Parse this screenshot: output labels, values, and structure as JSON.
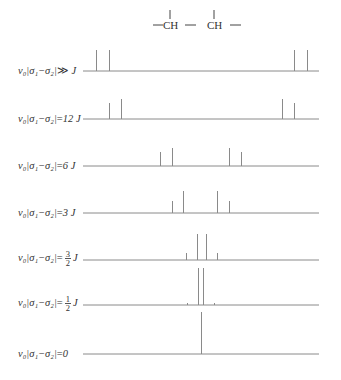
{
  "structure": {
    "groups": [
      "CH",
      "CH"
    ],
    "formula_text": "—CH—CH—"
  },
  "rows": [
    {
      "label_prefix": "ν₀|σ₁−σ₂|",
      "label_rel": "≫",
      "label_value": "J",
      "frac": null
    },
    {
      "label_prefix": "ν₀|σ₁−σ₂|",
      "label_rel": "=",
      "label_value": "12 J",
      "frac": null
    },
    {
      "label_prefix": "ν₀|σ₁−σ₂|",
      "label_rel": "=",
      "label_value": "6 J",
      "frac": null
    },
    {
      "label_prefix": "ν₀|σ₁−σ₂|",
      "label_rel": "=",
      "label_value": "3 J",
      "frac": null
    },
    {
      "label_prefix": "ν₀|σ₁−σ₂|",
      "label_rel": "=",
      "label_value": "J",
      "frac": {
        "num": "3",
        "den": "2"
      }
    },
    {
      "label_prefix": "ν₀|σ₁−σ₂|",
      "label_rel": "=",
      "label_value": "J",
      "frac": {
        "num": "1",
        "den": "2"
      }
    },
    {
      "label_prefix": "ν₀|σ₁−σ₂|",
      "label_rel": "=",
      "label_value": "0",
      "frac": null
    }
  ],
  "spectra": [
    {
      "baseline_y": 71,
      "peaks": [
        {
          "x": 96,
          "top": 50
        },
        {
          "x": 109,
          "top": 50
        },
        {
          "x": 294,
          "top": 50
        },
        {
          "x": 307,
          "top": 50
        }
      ]
    },
    {
      "baseline_y": 119,
      "peaks": [
        {
          "x": 109,
          "top": 103
        },
        {
          "x": 121,
          "top": 99
        },
        {
          "x": 282,
          "top": 99
        },
        {
          "x": 294,
          "top": 103
        }
      ]
    },
    {
      "baseline_y": 166,
      "peaks": [
        {
          "x": 160,
          "top": 152
        },
        {
          "x": 172,
          "top": 148
        },
        {
          "x": 229,
          "top": 148
        },
        {
          "x": 241,
          "top": 152
        }
      ]
    },
    {
      "baseline_y": 213,
      "peaks": [
        {
          "x": 172,
          "top": 201
        },
        {
          "x": 183,
          "top": 191
        },
        {
          "x": 217,
          "top": 191
        },
        {
          "x": 229,
          "top": 201
        }
      ]
    },
    {
      "baseline_y": 260,
      "peaks": [
        {
          "x": 186,
          "top": 253
        },
        {
          "x": 197,
          "top": 234
        },
        {
          "x": 206,
          "top": 234
        },
        {
          "x": 217,
          "top": 253
        }
      ]
    },
    {
      "baseline_y": 305,
      "peaks": [
        {
          "x": 187,
          "top": 303
        },
        {
          "x": 198,
          "top": 268
        },
        {
          "x": 203,
          "top": 268
        },
        {
          "x": 214,
          "top": 303
        }
      ]
    },
    {
      "baseline_y": 354,
      "peaks": [
        {
          "x": 201,
          "top": 312
        }
      ]
    }
  ],
  "axis": {
    "x_start": 83,
    "x_end": 319
  },
  "colors": {
    "line": "#8a8a8a",
    "text": "#333333"
  }
}
